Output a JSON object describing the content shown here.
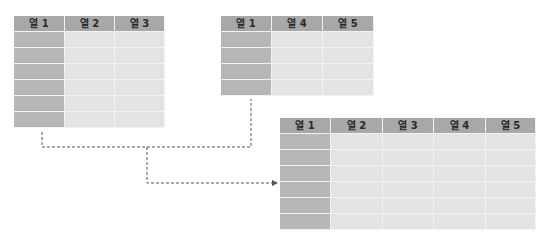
{
  "tables": {
    "left": {
      "headers": [
        "열 1",
        "열 2",
        "열 3"
      ],
      "rows": 6
    },
    "right": {
      "headers": [
        "열 1",
        "열 4",
        "열 5"
      ],
      "rows": 4
    },
    "result": {
      "headers": [
        "열 1",
        "열 2",
        "열 3",
        "열 4",
        "열 5"
      ],
      "rows": 6
    }
  },
  "colors": {
    "header": "#a8a8a8",
    "key_column": "#b7b7b7",
    "cell": "#e3e3e3",
    "connector": "#555555"
  }
}
